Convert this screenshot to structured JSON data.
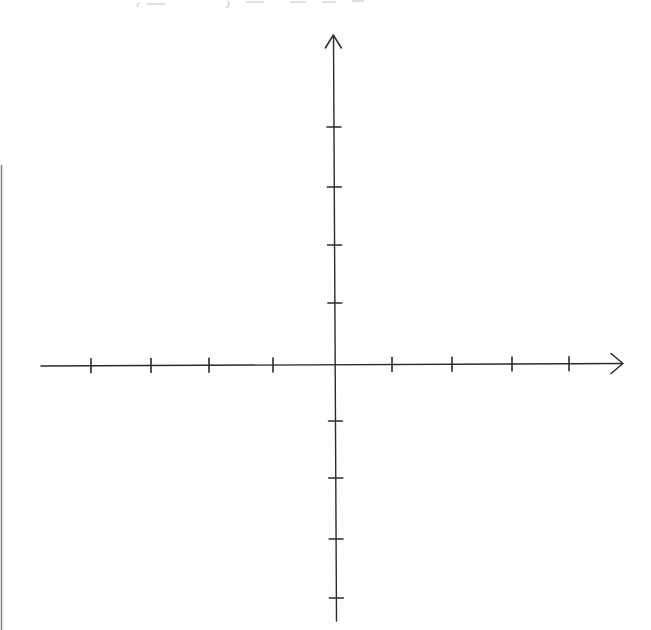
{
  "diagram": {
    "type": "coordinate-plane",
    "colors": {
      "ink": "#2a2a2a",
      "scan_border": "#8a8a8a",
      "faint_text": "#c9c9c9",
      "background": "#ffffff"
    },
    "x_axis": {
      "label": "",
      "ticks_negative": 4,
      "ticks_positive": 4,
      "tick_labels": [],
      "arrow_positive_end": true,
      "arrow_negative_end": false
    },
    "y_axis": {
      "label": "",
      "ticks_positive": 4,
      "ticks_negative": 4,
      "tick_labels": [],
      "arrow_positive_end": true,
      "arrow_negative_end": false
    },
    "header_text_clipped": true
  }
}
